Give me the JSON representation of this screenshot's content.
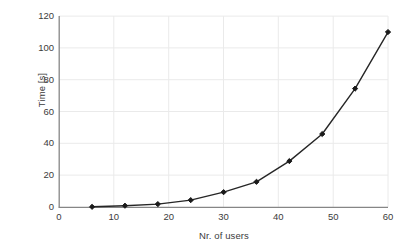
{
  "chart_data": {
    "type": "line",
    "title": "",
    "xlabel": "Nr. of users",
    "ylabel": "Time [s]",
    "x": [
      6,
      12,
      18,
      24,
      30,
      36,
      42,
      48,
      54,
      60
    ],
    "values": [
      0.3,
      1,
      2,
      4.5,
      9.5,
      16,
      29,
      46,
      74.5,
      110
    ],
    "series": [
      {
        "name": "Time [s]",
        "values": [
          0.3,
          1,
          2,
          4.5,
          9.5,
          16,
          29,
          46,
          74.5,
          110
        ]
      }
    ],
    "xlim": [
      0,
      60
    ],
    "ylim": [
      0,
      120
    ],
    "xticks": [
      0,
      10,
      20,
      30,
      40,
      50,
      60
    ],
    "yticks": [
      0,
      20,
      40,
      60,
      80,
      100,
      120
    ],
    "xtick_labels": [
      "0",
      "10",
      "20",
      "30",
      "40",
      "50",
      "60"
    ],
    "ytick_labels": [
      "0",
      "20",
      "40",
      "60",
      "80",
      "100",
      "120"
    ],
    "grid": true,
    "grid_axes": "both",
    "legend": false,
    "legend_position": "none",
    "marker": "diamond",
    "line_color": "#262626",
    "marker_color": "#1a1a1a",
    "grid_color": "#eaeaea",
    "axis_color": "#868686",
    "text_color": "#3b3b3b",
    "background": "#ffffff"
  }
}
